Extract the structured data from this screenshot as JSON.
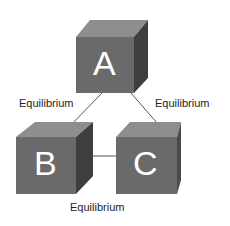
{
  "nodes": [
    {
      "id": "A",
      "label": "A"
    },
    {
      "id": "B",
      "label": "B"
    },
    {
      "id": "C",
      "label": "C"
    }
  ],
  "edges": [
    {
      "from": "A",
      "to": "B",
      "label": "Equilibrium"
    },
    {
      "from": "A",
      "to": "C",
      "label": "Equilibrium"
    },
    {
      "from": "B",
      "to": "C",
      "label": "Equilibrium"
    }
  ],
  "colors": {
    "front": "#6a6a6a",
    "top": "#8e8e8e",
    "side": "#3e3e3e",
    "text": "#ffffff",
    "line": "#555555"
  }
}
